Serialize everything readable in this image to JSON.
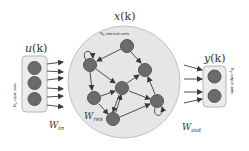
{
  "diagram": {
    "colors": {
      "node": "#6b6b6b",
      "node_stroke": "#555555",
      "reservoir_fill": "#e6e6e6",
      "reservoir_stroke": "#bdbdbd",
      "box_fill": "#ececec",
      "box_stroke": "#b5b5b5",
      "arrow": "#3a3a3a",
      "text": "#333333"
    },
    "input": {
      "label": "u(k)",
      "side_label": "Nu input units",
      "weight_label": "Win",
      "nodes": 3
    },
    "reservoir": {
      "label": "x(k)",
      "top_label": "Nx internal units",
      "weight_label": "Wres",
      "nodes": [
        {
          "id": "A",
          "x": 127,
          "y": 46
        },
        {
          "id": "B",
          "x": 90,
          "y": 65
        },
        {
          "id": "C",
          "x": 145,
          "y": 70
        },
        {
          "id": "D",
          "x": 122,
          "y": 88
        },
        {
          "id": "E",
          "x": 94,
          "y": 98
        },
        {
          "id": "F",
          "x": 157,
          "y": 101
        },
        {
          "id": "G",
          "x": 113,
          "y": 119
        }
      ],
      "edges": [
        [
          "A",
          "B"
        ],
        [
          "A",
          "C"
        ],
        [
          "B",
          "D"
        ],
        [
          "B",
          "E"
        ],
        [
          "B",
          "G"
        ],
        [
          "E",
          "D"
        ],
        [
          "E",
          "G"
        ],
        [
          "D",
          "C"
        ],
        [
          "D",
          "F"
        ],
        [
          "D",
          "G"
        ],
        [
          "G",
          "D"
        ],
        [
          "G",
          "F"
        ],
        [
          "F",
          "C"
        ],
        [
          "B",
          "B"
        ],
        [
          "F",
          "F"
        ]
      ]
    },
    "output": {
      "label": "y(k)",
      "side_label": "Ny output units",
      "weight_label": "Wout",
      "nodes": 2
    }
  },
  "labels": {
    "u_main": "u",
    "u_arg": "(k)",
    "x_main": "x",
    "x_arg": "(k)",
    "y_main": "y",
    "y_arg": "(k)",
    "input_units_prefix": "N",
    "input_units_sub": "u",
    "input_units_text": " input units",
    "internal_prefix": "N",
    "internal_sub": "x",
    "internal_text": " internal units",
    "output_prefix": "N",
    "output_sub": "y",
    "output_text": " output units",
    "w_in_main": "W",
    "w_in_sub": "in",
    "w_res_main": "W",
    "w_res_sub": "res",
    "w_out_main": "W",
    "w_out_sub": "out"
  }
}
